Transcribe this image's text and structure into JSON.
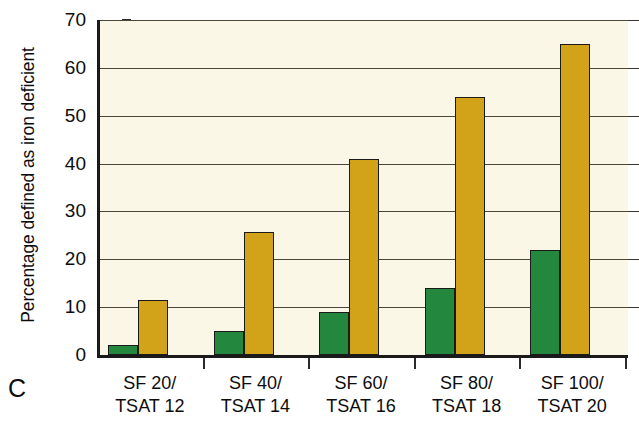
{
  "panel": {
    "letter": "C"
  },
  "chart_data": {
    "type": "bar",
    "title": "",
    "xlabel": "",
    "ylabel": "Percentage defined as iron deficient",
    "ylim": [
      0,
      70
    ],
    "ytick_step": 10,
    "yticks": [
      0,
      10,
      20,
      30,
      40,
      50,
      60,
      70
    ],
    "ytick_labels": [
      "0",
      "10",
      "20",
      "30",
      "40",
      "50",
      "60",
      "70"
    ],
    "grid": true,
    "legend": "none",
    "categories": [
      "SF 20/\nTSAT 12",
      "SF 40/\nTSAT 14",
      "SF 60/\nTSAT 16",
      "SF 80/\nTSAT 18",
      "SF 100/\nTSAT 20"
    ],
    "category_lines": [
      [
        "SF 20/",
        "TSAT 12"
      ],
      [
        "SF 40/",
        "TSAT 14"
      ],
      [
        "SF 60/",
        "TSAT 16"
      ],
      [
        "SF 80/",
        "TSAT 18"
      ],
      [
        "SF 100/",
        "TSAT 20"
      ]
    ],
    "series": [
      {
        "name": "green-series",
        "color": "#23873d",
        "values": [
          2,
          5,
          9,
          14,
          22
        ]
      },
      {
        "name": "gold-series",
        "color": "#d2a318",
        "values": [
          11.5,
          25.7,
          41,
          54,
          65
        ]
      }
    ]
  },
  "colors": {
    "plot_background": "#faf7e6",
    "axis": "#1a1a1a",
    "gridline": "#4a463c",
    "green": "#23873d",
    "gold": "#d2a318",
    "page_background": "#ffffff"
  }
}
